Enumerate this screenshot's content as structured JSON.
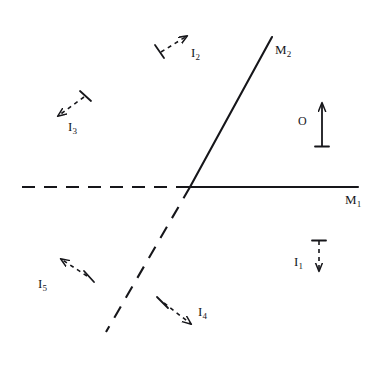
{
  "figure": {
    "background_color": "#ffffff",
    "ink_color": "#16161a",
    "width": 383,
    "height": 376,
    "vertex": {
      "x": 190,
      "y": 187
    }
  },
  "labels": {
    "mirror1": "M",
    "mirror1_sub": "1",
    "mirror2": "M",
    "mirror2_sub": "2",
    "object": "O",
    "image1": "I",
    "image1_sub": "1",
    "image2": "I",
    "image2_sub": "2",
    "image3": "I",
    "image3_sub": "3",
    "image4": "I",
    "image4_sub": "4",
    "image5": "I",
    "image5_sub": "5"
  },
  "mirrors": [
    {
      "name": "M1",
      "label": "M",
      "subscript": "1",
      "solid_segment": {
        "x1": 190,
        "y1": 187,
        "x2": 358,
        "y2": 187
      },
      "dashed_extension": {
        "x1": 22,
        "y1": 187,
        "x2": 190,
        "y2": 187
      },
      "label_pos": {
        "x": 345,
        "y": 198
      }
    },
    {
      "name": "M2",
      "label": "M",
      "subscript": "2",
      "solid_segment": {
        "x1": 190,
        "y1": 187,
        "x2": 272,
        "y2": 37
      },
      "dashed_extension": {
        "x1": 190,
        "y1": 187,
        "x2": 106,
        "y2": 332
      },
      "label_pos": {
        "x": 276,
        "y": 48
      }
    }
  ],
  "object": {
    "name": "O",
    "label": "O",
    "style": "solid",
    "direction": "up",
    "arrow": {
      "x1": 322,
      "y1": 146,
      "x2": 322,
      "y2": 101
    },
    "base_bar": {
      "x1": 315,
      "y1": 146,
      "x2": 329,
      "y2": 146
    },
    "label_pos": {
      "x": 300,
      "y": 121
    }
  },
  "images": [
    {
      "name": "I1",
      "label": "I",
      "subscript": "1",
      "style": "dashed",
      "direction": "down",
      "arrow": {
        "x1": 319,
        "y1": 240,
        "x2": 319,
        "y2": 273
      },
      "tail_bar": {
        "x1": 312,
        "y1": 240,
        "x2": 326,
        "y2": 240
      },
      "label_pos": {
        "x": 296,
        "y": 262
      }
    },
    {
      "name": "I2",
      "label": "I",
      "subscript": "2",
      "style": "dashed",
      "direction": "up-right",
      "arrow": {
        "x1": 160,
        "y1": 53,
        "x2": 189,
        "y2": 34
      },
      "tail_bar": {
        "x1": 155,
        "y1": 45,
        "x2": 164,
        "y2": 58
      },
      "label_pos": {
        "x": 192,
        "y": 53
      }
    },
    {
      "name": "I3",
      "label": "I",
      "subscript": "3",
      "style": "dashed",
      "direction": "down-left",
      "arrow": {
        "x1": 85,
        "y1": 96,
        "x2": 56,
        "y2": 118
      },
      "tail_bar": {
        "x1": 80,
        "y1": 91,
        "x2": 91,
        "y2": 101
      },
      "label_pos": {
        "x": 70,
        "y": 126
      }
    },
    {
      "name": "I4",
      "label": "I",
      "subscript": "4",
      "style": "dashed",
      "direction": "down-right",
      "arrow": {
        "x1": 163,
        "y1": 302,
        "x2": 193,
        "y2": 326
      },
      "tail_bar": {
        "x1": 157,
        "y1": 297,
        "x2": 168,
        "y2": 308
      },
      "label_pos": {
        "x": 199,
        "y": 312
      }
    },
    {
      "name": "I5",
      "label": "I",
      "subscript": "5",
      "style": "dashed",
      "direction": "up-left",
      "arrow": {
        "x1": 88,
        "y1": 277,
        "x2": 59,
        "y2": 257
      },
      "tail_bar": {
        "x1": 84,
        "y1": 271,
        "x2": 94,
        "y2": 282
      },
      "label_pos": {
        "x": 40,
        "y": 284
      }
    }
  ]
}
